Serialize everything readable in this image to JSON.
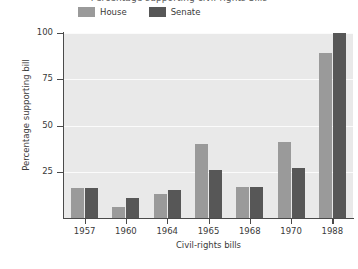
{
  "chart_data": {
    "type": "bar",
    "title": "Percentage supporting civil-rights bills",
    "xlabel": "Civil-rights bills",
    "ylabel": "Percentage supporting bill",
    "categories": [
      "1957",
      "1960",
      "1964",
      "1965",
      "1968",
      "1970",
      "1988"
    ],
    "series": [
      {
        "name": "House",
        "color": "#9a9a9a",
        "values": [
          16,
          6,
          13,
          40,
          17,
          41,
          89
        ]
      },
      {
        "name": "Senate",
        "color": "#575757",
        "values": [
          16,
          11,
          15,
          26,
          17,
          27,
          100
        ]
      }
    ],
    "ylim": [
      0,
      100
    ],
    "yticks": [
      25,
      50,
      75,
      100
    ],
    "ytick_labels": [
      "25",
      "50",
      "75",
      "100"
    ],
    "grid": "horizontal-only",
    "legend_position": "top-left",
    "plot_background": "#e9e9e9",
    "gridline_color": "#fbfbfb",
    "axis_color": "#4a4a4a"
  }
}
